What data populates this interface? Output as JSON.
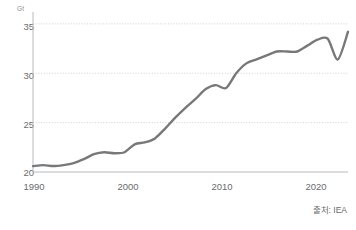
{
  "chart_data": {
    "type": "line",
    "title": "",
    "subtitle": "",
    "xlabel": "",
    "ylabel": "",
    "unit_label": "Gt",
    "xlim": [
      1990,
      2021
    ],
    "ylim": [
      20,
      36
    ],
    "ytick_labels": [
      "20",
      "25",
      "30",
      "35"
    ],
    "ytick_values": [
      20,
      25,
      30,
      35
    ],
    "xtick_labels": [
      "1990",
      "2000",
      "2010",
      "2020"
    ],
    "xtick_values": [
      1990,
      2000,
      2010,
      2020
    ],
    "grid": "horizontal-dotted",
    "legend": "none",
    "line_color": "#77787a",
    "grid_color": "#c9cacc",
    "axis_color": "#b9babc",
    "series": [
      {
        "name": "CO2 emissions",
        "x": [
          1990,
          1991,
          1992,
          1993,
          1994,
          1995,
          1996,
          1997,
          1998,
          1999,
          2000,
          2001,
          2002,
          2003,
          2004,
          2005,
          2006,
          2007,
          2008,
          2009,
          2010,
          2011,
          2012,
          2013,
          2014,
          2015,
          2016,
          2017,
          2018,
          2019,
          2020,
          2021
        ],
        "values": [
          20.6,
          20.7,
          20.6,
          20.7,
          20.9,
          21.3,
          21.8,
          22.0,
          21.9,
          22.0,
          22.8,
          23.0,
          23.4,
          24.4,
          25.5,
          26.5,
          27.4,
          28.4,
          28.8,
          28.5,
          30.0,
          31.0,
          31.4,
          31.8,
          32.2,
          32.2,
          32.2,
          32.8,
          33.4,
          33.5,
          31.4,
          34.2
        ]
      }
    ]
  },
  "footer": {
    "source_text": "출처: IEA"
  }
}
